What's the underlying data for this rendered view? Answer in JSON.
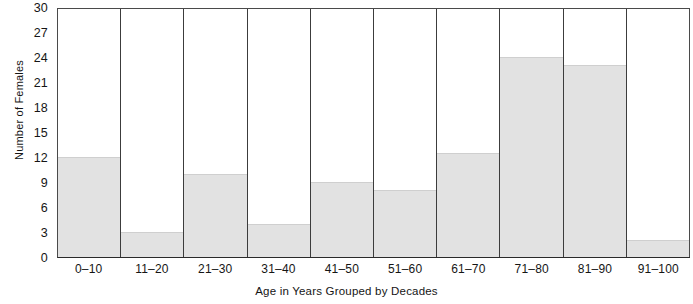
{
  "chart_data": {
    "type": "bar",
    "title": "",
    "xlabel": "Age in Years Grouped by Decades",
    "ylabel": "Number of Females",
    "categories": [
      "0–10",
      "11–20",
      "21–30",
      "31–40",
      "41–50",
      "51–60",
      "61–70",
      "71–80",
      "81–90",
      "91–100"
    ],
    "values": [
      12,
      3,
      10,
      4,
      9,
      8,
      12.5,
      24,
      23,
      2
    ],
    "ylim": [
      0,
      30
    ],
    "ytick_values": [
      0,
      3,
      6,
      9,
      12,
      15,
      18,
      21,
      24,
      27,
      30
    ],
    "ytick_labels": [
      "0",
      "3",
      "6",
      "9",
      "12",
      "15",
      "18",
      "21",
      "24",
      "27",
      "30"
    ],
    "grid": false,
    "legend": null,
    "bar_fill_color": "#e2e2e2",
    "bar_edge_color": "#3c3c3c",
    "axis_color": "#2a2a2a",
    "background_color": "#ffffff"
  },
  "axes": {
    "y_title": "Number of Females",
    "x_title": "Age in Years Grouped by Decades"
  }
}
